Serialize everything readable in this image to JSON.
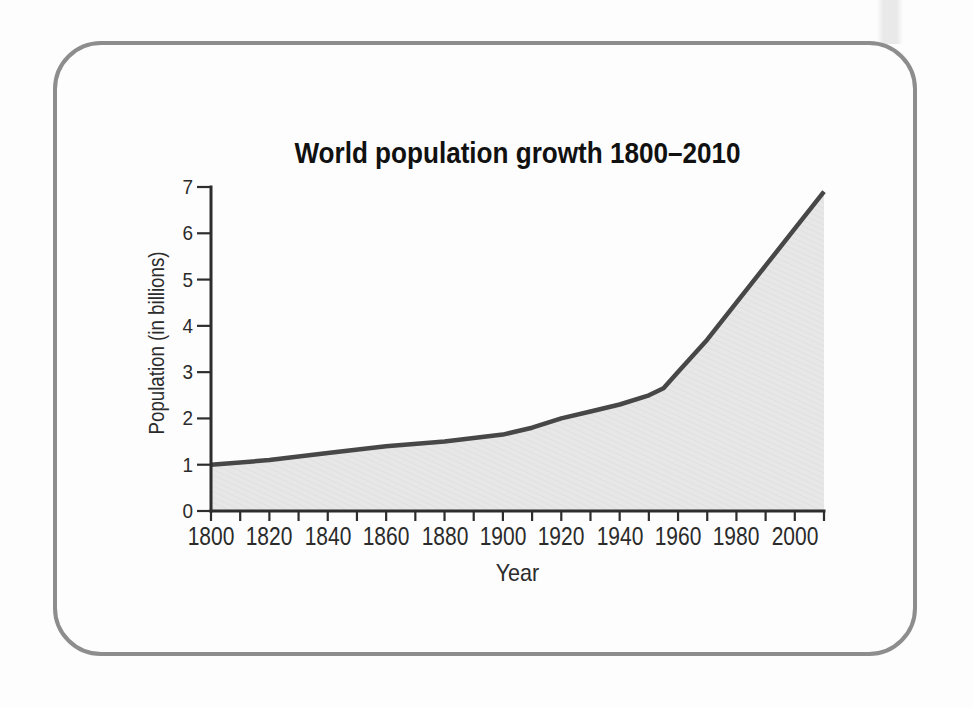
{
  "page": {
    "background_color": "#fdfdfd",
    "scan_strip_color": "#e9e9e9"
  },
  "figure": {
    "border_color": "#8d8d8d"
  },
  "chart_data": {
    "type": "area",
    "title": "World population growth 1800–2010",
    "xlabel": "Year",
    "ylabel": "Population (in billions)",
    "x": [
      1800,
      1820,
      1840,
      1860,
      1880,
      1900,
      1910,
      1920,
      1930,
      1940,
      1950,
      1955,
      1960,
      1970,
      1980,
      1990,
      2000,
      2010
    ],
    "series": [
      {
        "name": "World population (billions)",
        "values": [
          1.0,
          1.1,
          1.25,
          1.4,
          1.5,
          1.65,
          1.8,
          2.0,
          2.15,
          2.3,
          2.5,
          2.65,
          3.0,
          3.7,
          4.5,
          5.3,
          6.1,
          6.9
        ]
      }
    ],
    "xlim": [
      1800,
      2010
    ],
    "ylim": [
      0,
      7
    ],
    "x_tick_labels": [
      1800,
      1820,
      1840,
      1860,
      1880,
      1900,
      1920,
      1940,
      1960,
      1980,
      2000
    ],
    "x_minor_tick_step": 10,
    "y_tick_labels": [
      0,
      1,
      2,
      3,
      4,
      5,
      6,
      7
    ],
    "grid": false,
    "legend": "none",
    "line_color": "#474747",
    "fill_color": "#e7e7e7",
    "hatch_color": "#dddddd",
    "axis_color": "#2d2d2d",
    "label_color": "#2b2b2b"
  }
}
